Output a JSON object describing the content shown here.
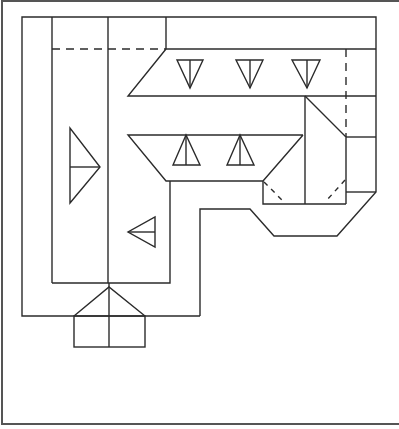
{
  "diagram": {
    "type": "roof-plan",
    "colors": {
      "line": "#2b2b2b",
      "frame": "#555555",
      "background": "#ffffff"
    },
    "frame": {
      "left": 2,
      "top": 1,
      "bottom": 424
    },
    "elements": [
      {
        "name": "outer-building-outline"
      },
      {
        "name": "left-wing-ridge-lines"
      },
      {
        "name": "upper-hip-trapezoid",
        "slope_arrows": 3,
        "arrow_direction": "down"
      },
      {
        "name": "lower-hip-trapezoid",
        "slope_arrows": 2,
        "arrow_direction": "up"
      },
      {
        "name": "left-slope-arrow",
        "arrow_direction": "right"
      },
      {
        "name": "inner-slope-arrow",
        "arrow_direction": "left"
      },
      {
        "name": "entrance-porch-gable"
      },
      {
        "name": "right-corner-hip-section"
      },
      {
        "name": "dashed-valley-lines",
        "count": 4
      }
    ]
  }
}
